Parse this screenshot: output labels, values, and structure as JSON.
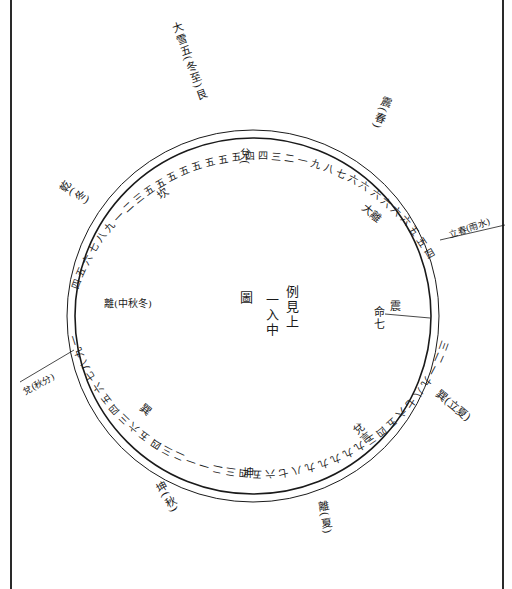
{
  "diagram": {
    "type": "circular-calendar-chart",
    "frame": {
      "left_x": 11,
      "right_x": 503
    },
    "circle": {
      "cx": 253,
      "cy": 316,
      "r_inner": 178,
      "r_outer": 186
    },
    "center_text": {
      "col1": "例見上",
      "col2": "一入中",
      "col3": "圖"
    },
    "spokes": [
      {
        "name": "top-left",
        "angle": -118,
        "label": "大雪五(冬至)艮"
      },
      {
        "name": "top-right",
        "angle": -62,
        "label": "震(春)"
      },
      {
        "name": "right-upper",
        "angle": -18,
        "label": "立春(雨水)"
      },
      {
        "name": "right-lower",
        "angle": 32,
        "label": "巽(立夏)"
      },
      {
        "name": "bottom-right",
        "angle": 70,
        "label": "離(夏)"
      },
      {
        "name": "bottom-left",
        "angle": 118,
        "label": "坤(秋)"
      },
      {
        "name": "left-lower",
        "angle": 168,
        "label": "兌(秋分)"
      },
      {
        "name": "left-upper",
        "angle": -158,
        "label": "乾(冬)"
      }
    ],
    "inner_labels": [
      {
        "name": "dui",
        "text": "兌(",
        "x": 238,
        "y": 148
      },
      {
        "name": "top-left-inner",
        "text": "坎",
        "x": 158,
        "y": 188
      },
      {
        "name": "top-right-inner",
        "text": "大離",
        "x": 360,
        "y": 208
      },
      {
        "name": "left-inner",
        "text": "離(中秋冬)",
        "x": 104,
        "y": 300
      },
      {
        "name": "right-inner-1",
        "text": "震",
        "x": 388,
        "y": 305
      },
      {
        "name": "right-inner-2",
        "text": "命七",
        "x": 373,
        "y": 310
      },
      {
        "name": "lower-left-inner",
        "text": "巽",
        "x": 140,
        "y": 404
      },
      {
        "name": "lower-right-inner",
        "text": "兌言",
        "x": 355,
        "y": 432
      },
      {
        "name": "bottom-inner",
        "text": "坤",
        "x": 243,
        "y": 470
      }
    ],
    "ring_numbers": {
      "top": "五五五五五五五五四四三二一九八七六",
      "right": "六六六六六五五四三二一九八七六五四三",
      "bottom": "九九九九九八七六五四三二一一二三四五六",
      "left": "三四五六七八九一二三四五六七八九一二三"
    }
  }
}
